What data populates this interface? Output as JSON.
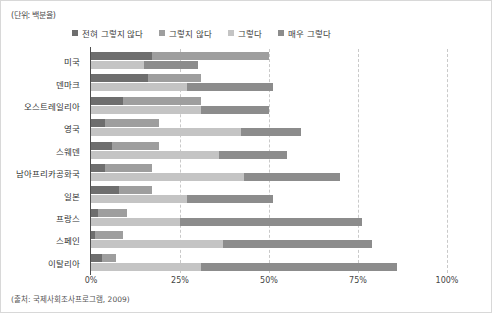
{
  "unit_note": "(단위: 백분율)",
  "source_note": "(출처: 국제사회조사프로그램, 2009)",
  "legend": {
    "items": [
      {
        "label": "전혀 그렇지 않다",
        "color": "#6e6e6e"
      },
      {
        "label": "그렇지 않다",
        "color": "#9e9e9e"
      },
      {
        "label": "그렇다",
        "color": "#c4c4c4"
      },
      {
        "label": "매우 그렇다",
        "color": "#8c8c8c"
      }
    ]
  },
  "axis": {
    "x_ticks": [
      "0%",
      "25%",
      "50%",
      "75%",
      "100%"
    ],
    "x_values": [
      0,
      25,
      50,
      75,
      100
    ],
    "xmin": 0,
    "xmax": 100,
    "grid": "dashed-vertical"
  },
  "chart_data": {
    "type": "bar",
    "orientation": "horizontal",
    "stacked": true,
    "title": "",
    "subtitle": "",
    "xlabel": "",
    "ylabel": "",
    "xlim": [
      0,
      100
    ],
    "grid": true,
    "legend_position": "top",
    "categories": [
      "미국",
      "덴마크",
      "오스트레일리아",
      "영국",
      "스웨덴",
      "남아프리카공화국",
      "일본",
      "프랑스",
      "스페인",
      "이탈리아"
    ],
    "series": [
      {
        "name": "전혀 그렇지 않다",
        "color": "#6e6e6e",
        "row": 0,
        "values": [
          17,
          16,
          9,
          4,
          6,
          4,
          8,
          2,
          1,
          3
        ]
      },
      {
        "name": "그렇지 않다",
        "color": "#9e9e9e",
        "row": 0,
        "values": [
          33,
          15,
          22,
          15,
          13,
          13,
          9,
          8,
          8,
          4
        ]
      },
      {
        "name": "그렇다",
        "color": "#c4c4c4",
        "row": 1,
        "values": [
          15,
          27,
          31,
          42,
          36,
          43,
          27,
          25,
          37,
          31
        ]
      },
      {
        "name": "매우 그렇다",
        "color": "#8c8c8c",
        "row": 1,
        "values": [
          15,
          24,
          19,
          17,
          19,
          27,
          24,
          51,
          42,
          55
        ]
      }
    ]
  }
}
